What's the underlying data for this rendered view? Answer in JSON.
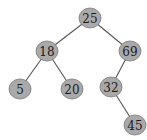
{
  "diagram": {
    "type": "binary-search-tree",
    "node_fill": "#a9a9a9",
    "node_stroke": "#7a7a7a",
    "edge_color": "#555555",
    "nodes": [
      {
        "id": "n25",
        "label": "25",
        "cx": 90,
        "cy": 18
      },
      {
        "id": "n18",
        "label": "18",
        "cx": 47,
        "cy": 51
      },
      {
        "id": "n69",
        "label": "69",
        "cx": 130,
        "cy": 51
      },
      {
        "id": "n5",
        "label": "5",
        "cx": 20,
        "cy": 89
      },
      {
        "id": "n20",
        "label": "20",
        "cx": 72,
        "cy": 89
      },
      {
        "id": "n32",
        "label": "32",
        "cx": 111,
        "cy": 87
      },
      {
        "id": "n45",
        "label": "45",
        "cx": 135,
        "cy": 125
      }
    ],
    "edges": [
      {
        "from": "n25",
        "to": "n18"
      },
      {
        "from": "n25",
        "to": "n69"
      },
      {
        "from": "n18",
        "to": "n5"
      },
      {
        "from": "n18",
        "to": "n20"
      },
      {
        "from": "n69",
        "to": "n32"
      },
      {
        "from": "n32",
        "to": "n45"
      }
    ]
  }
}
